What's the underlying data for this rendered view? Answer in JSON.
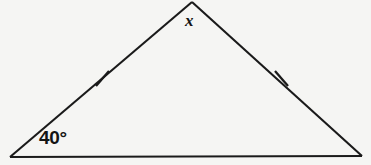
{
  "figure": {
    "kind": "isosceles-triangle-diagram",
    "canvas": {
      "width": 371,
      "height": 165
    },
    "background_color": "#f5f5f3",
    "stroke_color": "#1a1a1a",
    "text_color": "#141414",
    "vertices": {
      "left": {
        "x": 10,
        "y": 157
      },
      "apex": {
        "x": 192,
        "y": 2
      },
      "right": {
        "x": 362,
        "y": 156
      }
    },
    "edges": [
      {
        "name": "left-side",
        "from": "left",
        "to": "apex",
        "congruent": true
      },
      {
        "name": "right-side",
        "from": "apex",
        "to": "right",
        "congruent": true
      },
      {
        "name": "base",
        "from": "left",
        "to": "right",
        "congruent": false
      }
    ],
    "tick_marks": [
      {
        "name": "left-side-tick",
        "cx": 102,
        "cy": 79,
        "x1": 96,
        "y1": 86,
        "x2": 109,
        "y2": 71
      },
      {
        "name": "right-side-tick",
        "cx": 281,
        "cy": 78,
        "x1": 275,
        "y1": 71,
        "x2": 288,
        "y2": 86
      }
    ],
    "labels": {
      "angle": {
        "text": "40°",
        "value": 40,
        "unit": "degrees",
        "at_vertex": "left"
      },
      "variable": {
        "text": "x",
        "at_vertex": "apex"
      }
    }
  }
}
